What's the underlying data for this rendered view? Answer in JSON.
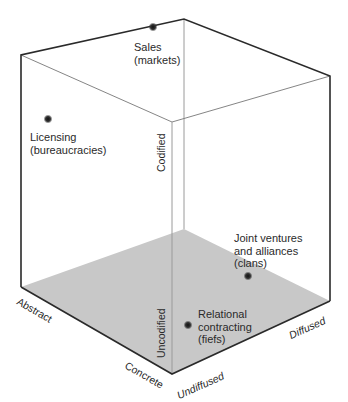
{
  "diagram": {
    "type": "i-space-cube",
    "colors": {
      "floor": "#c8c8c8",
      "edge": "#2a2a2a",
      "hidden_edge": "#9a9a9a",
      "dot": "#222222"
    },
    "points": [
      {
        "id": "sales",
        "line1": "Sales",
        "line2": "(markets)"
      },
      {
        "id": "licensing",
        "line1": "Licensing",
        "line2": "(bureaucracies)"
      },
      {
        "id": "joint",
        "line1": "Joint ventures",
        "line2": "and alliances",
        "line3": "(clans)"
      },
      {
        "id": "relational",
        "line1": "Relational",
        "line2": "contracting",
        "line3": "(fiefs)"
      }
    ],
    "axes": {
      "codified": "Codified",
      "uncodified": "Uncodified",
      "abstract": "Abstract",
      "concrete": "Concrete",
      "undiffused": "Undiffused",
      "diffused": "Diffused"
    }
  }
}
